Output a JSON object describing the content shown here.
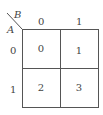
{
  "kmap": {
    "col_var": "B",
    "row_var": "A",
    "col_headers": [
      "0",
      "1"
    ],
    "row_headers": [
      "0",
      "1"
    ],
    "cells": [
      [
        "0",
        "1"
      ],
      [
        "2",
        "3"
      ]
    ],
    "line_color": "#555555"
  }
}
